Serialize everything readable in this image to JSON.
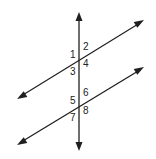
{
  "diagram": {
    "colors": {
      "stroke": "#1f1f1f",
      "text": "#222222",
      "background": "#ffffff"
    },
    "transversal": {
      "x1": 79,
      "y1": 13,
      "x2": 79,
      "y2": 150
    },
    "parallel_lines": [
      {
        "name": "top-line",
        "x1": 18,
        "y1": 98,
        "x2": 143,
        "y2": 21
      },
      {
        "name": "bottom-line",
        "x1": 18,
        "y1": 144,
        "x2": 143,
        "y2": 68
      }
    ],
    "angle_labels": [
      {
        "text": "1",
        "x": 70,
        "y": 58
      },
      {
        "text": "2",
        "x": 83,
        "y": 50
      },
      {
        "text": "3",
        "x": 70,
        "y": 75
      },
      {
        "text": "4",
        "x": 83,
        "y": 67
      },
      {
        "text": "5",
        "x": 70,
        "y": 104
      },
      {
        "text": "6",
        "x": 83,
        "y": 96
      },
      {
        "text": "7",
        "x": 70,
        "y": 121
      },
      {
        "text": "8",
        "x": 83,
        "y": 114
      }
    ]
  }
}
